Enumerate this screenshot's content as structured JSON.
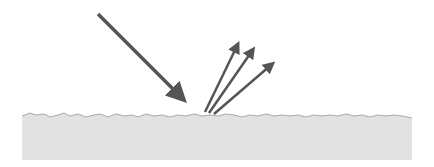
{
  "diagram": {
    "title": "",
    "colors": {
      "background": "#ffffff",
      "surface_fill": "#e2e2e2",
      "surface_edge": "#a8a8a8",
      "arrow": "#555555"
    },
    "incident_ray": {
      "from": [
        98,
        14
      ],
      "to": [
        188,
        104
      ]
    },
    "reflected_rays": [
      {
        "from": [
          205,
          112
        ],
        "to": [
          241,
          38
        ]
      },
      {
        "from": [
          209,
          113
        ],
        "to": [
          257,
          44
        ]
      },
      {
        "from": [
          214,
          114
        ],
        "to": [
          278,
          60
        ]
      }
    ],
    "surface": {
      "x_start": 22,
      "x_end": 412,
      "top": 113,
      "bottom": 160
    }
  }
}
